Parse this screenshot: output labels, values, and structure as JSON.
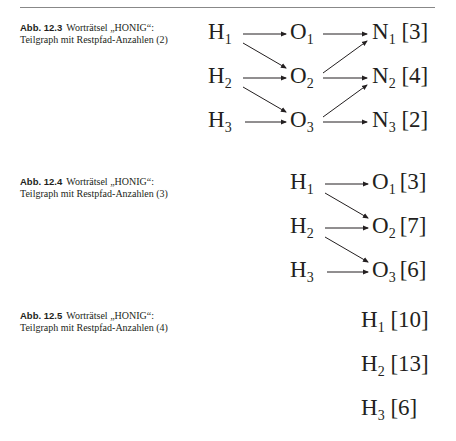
{
  "figures": [
    {
      "label": "Abb. 12.3",
      "caption": "Worträtsel „HONIG“: Teilgraph mit Restpfad-Anzahlen (2)",
      "nodes": [
        {
          "id": "H1",
          "letter": "H",
          "sub": "1",
          "count": ""
        },
        {
          "id": "H2",
          "letter": "H",
          "sub": "2",
          "count": ""
        },
        {
          "id": "H3",
          "letter": "H",
          "sub": "3",
          "count": ""
        },
        {
          "id": "O1",
          "letter": "O",
          "sub": "1",
          "count": ""
        },
        {
          "id": "O2",
          "letter": "O",
          "sub": "2",
          "count": ""
        },
        {
          "id": "O3",
          "letter": "O",
          "sub": "3",
          "count": ""
        },
        {
          "id": "N1",
          "letter": "N",
          "sub": "1",
          "count": "[3]"
        },
        {
          "id": "N2",
          "letter": "N",
          "sub": "2",
          "count": "[4]"
        },
        {
          "id": "N3",
          "letter": "N",
          "sub": "3",
          "count": "[2]"
        }
      ],
      "edges": [
        [
          "H1",
          "O1"
        ],
        [
          "H1",
          "O2"
        ],
        [
          "H2",
          "O2"
        ],
        [
          "H2",
          "O3"
        ],
        [
          "H3",
          "O3"
        ],
        [
          "O1",
          "N1"
        ],
        [
          "O2",
          "N1"
        ],
        [
          "O2",
          "N2"
        ],
        [
          "O3",
          "N2"
        ],
        [
          "O3",
          "N3"
        ]
      ]
    },
    {
      "label": "Abb. 12.4",
      "caption": "Worträtsel „HONIG“: Teilgraph mit Restpfad-Anzahlen (3)",
      "nodes": [
        {
          "id": "H1",
          "letter": "H",
          "sub": "1",
          "count": ""
        },
        {
          "id": "H2",
          "letter": "H",
          "sub": "2",
          "count": ""
        },
        {
          "id": "H3",
          "letter": "H",
          "sub": "3",
          "count": ""
        },
        {
          "id": "O1",
          "letter": "O",
          "sub": "1",
          "count": "[3]"
        },
        {
          "id": "O2",
          "letter": "O",
          "sub": "2",
          "count": "[7]"
        },
        {
          "id": "O3",
          "letter": "O",
          "sub": "3",
          "count": "[6]"
        }
      ],
      "edges": [
        [
          "H1",
          "O1"
        ],
        [
          "H1",
          "O2"
        ],
        [
          "H2",
          "O2"
        ],
        [
          "H2",
          "O3"
        ],
        [
          "H3",
          "O3"
        ]
      ]
    },
    {
      "label": "Abb. 12.5",
      "caption": "Worträtsel „HONIG“: Teilgraph mit Restpfad-Anzahlen (4)",
      "nodes": [
        {
          "id": "H1",
          "letter": "H",
          "sub": "1",
          "count": "[10]"
        },
        {
          "id": "H2",
          "letter": "H",
          "sub": "2",
          "count": "[13]"
        },
        {
          "id": "H3",
          "letter": "H",
          "sub": "3",
          "count": "[6]"
        }
      ],
      "edges": []
    }
  ]
}
